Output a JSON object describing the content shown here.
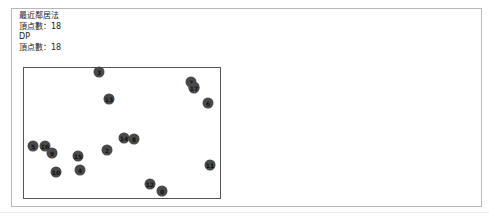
{
  "info": {
    "method1_title": "最近鄰居法",
    "method1_vertices": "頂点數：18",
    "method2_title": "DP",
    "method2_vertices": "頂点數：18"
  },
  "nodes": [
    {
      "id": "0",
      "x": 162,
      "y": 191
    },
    {
      "id": "1",
      "x": 194,
      "y": 87
    },
    {
      "id": "2",
      "x": 107,
      "y": 150
    },
    {
      "id": "3",
      "x": 99,
      "y": 72
    },
    {
      "id": "4",
      "x": 80,
      "y": 170
    },
    {
      "id": "5",
      "x": 33,
      "y": 146
    },
    {
      "id": "6",
      "x": 208,
      "y": 103
    },
    {
      "id": "7",
      "x": 191,
      "y": 82
    },
    {
      "id": "8",
      "x": 134,
      "y": 139
    },
    {
      "id": "9",
      "x": 52,
      "y": 153
    },
    {
      "id": "10",
      "x": 56,
      "y": 172
    },
    {
      "id": "11",
      "x": 210,
      "y": 165
    },
    {
      "id": "12",
      "x": 150,
      "y": 184
    },
    {
      "id": "13",
      "x": 109,
      "y": 99
    },
    {
      "id": "14",
      "x": 124,
      "y": 138
    },
    {
      "id": "15",
      "x": 78,
      "y": 156
    },
    {
      "id": "16",
      "x": 45,
      "y": 146
    },
    {
      "id": "17",
      "x": 194,
      "y": 88
    }
  ]
}
